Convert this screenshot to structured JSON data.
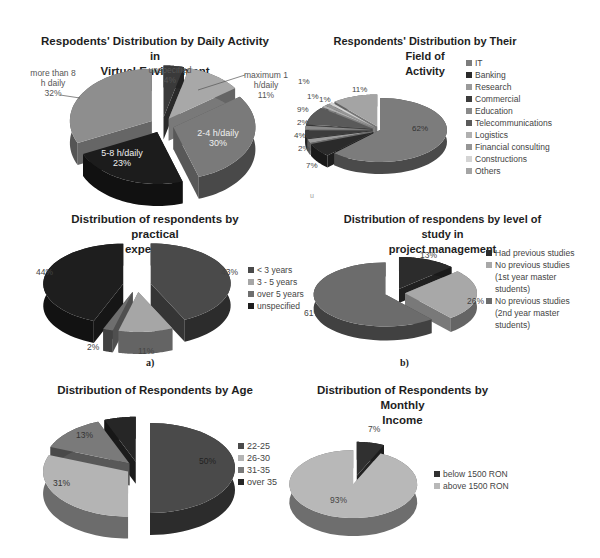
{
  "chart_data": [
    {
      "id": "daily-activity",
      "type": "pie",
      "title": "Respodents' Distribution by Daily Activity in Virtual Environment",
      "title_lines": [
        "Respodents' Distribution by Daily Activity in",
        "Virtual Environment"
      ],
      "categories": [
        "unspecified",
        "maximum 1 h/daily",
        "2-4 h/daily",
        "5-8 h/daily",
        "more than 8 h daily"
      ],
      "values": [
        4,
        11,
        30,
        23,
        32
      ],
      "value_labels": [
        "4%",
        "11%",
        "30%",
        "23%",
        "32%"
      ],
      "colors": [
        "#3a3a3a",
        "#a8a8a8",
        "#7a7a7a",
        "#1c1c1c",
        "#8e8e8e"
      ],
      "legend": "none (data labels)",
      "exploded": true
    },
    {
      "id": "field-of-activity",
      "type": "pie",
      "title": "Respondents' Distribution by Their Field of Activity",
      "title_lines": [
        "Respondents' Distribution by Their Field of",
        "Activity"
      ],
      "categories": [
        "IT",
        "Banking",
        "Research",
        "Commercial",
        "Education",
        "Telecommunications",
        "Logistics",
        "Financial consulting",
        "Constructions",
        "Others"
      ],
      "values": [
        62,
        7,
        2,
        4,
        2,
        9,
        1,
        1,
        1,
        11
      ],
      "value_labels": [
        "62%",
        "7%",
        "2%",
        "4%",
        "2%",
        "9%",
        "1%",
        "1%",
        "1%",
        "11%"
      ],
      "colors": [
        "#7c7c7c",
        "#2a2a2a",
        "#9a9a9a",
        "#3c3c3c",
        "#8a8a8a",
        "#5a5a5a",
        "#b0b0b0",
        "#969696",
        "#d4d4d4",
        "#a4a4a4"
      ],
      "legend": "right",
      "exploded": true
    },
    {
      "id": "practical-experience",
      "type": "pie",
      "title": "Distribution of respondents by practical experience",
      "title_lines": [
        "Distribution of respondents by practical",
        "experience"
      ],
      "categories": [
        "< 3 years",
        "3 - 5 years",
        "over 5 years",
        "unspecified"
      ],
      "values": [
        43,
        11,
        2,
        44
      ],
      "value_labels": [
        "43%",
        "11%",
        "2%",
        "44%"
      ],
      "colors": [
        "#4a4a4a",
        "#a6a6a6",
        "#6e6e6e",
        "#1e1e1e"
      ],
      "legend": "right",
      "exploded": true,
      "sublabel": "a)"
    },
    {
      "id": "study-level",
      "type": "pie",
      "title": "Distribution of respondens by level of study in project management",
      "title_lines": [
        "Distribution of respondens by level of study in",
        "project management"
      ],
      "categories": [
        "Had previous studies",
        "No previous studies (1st year master students)",
        "No previous studies (2nd year master students)"
      ],
      "values": [
        13,
        26,
        61
      ],
      "value_labels": [
        "13%",
        "26%",
        "61%"
      ],
      "colors": [
        "#2c2c2c",
        "#a8a8a8",
        "#6c6c6c"
      ],
      "legend": "right",
      "exploded": true,
      "sublabel": "b)"
    },
    {
      "id": "age",
      "type": "pie",
      "title": "Distribution of Respondents by Age",
      "title_lines": [
        "Distribution of Respondents by Age"
      ],
      "categories": [
        "22-25",
        "26-30",
        "31-35",
        "over 35"
      ],
      "values": [
        50,
        31,
        13,
        6
      ],
      "value_labels": [
        "50%",
        "31%",
        "13%",
        ""
      ],
      "colors": [
        "#4a4a4a",
        "#b4b4b4",
        "#7a7a7a",
        "#262626"
      ],
      "legend": "right",
      "exploded": true
    },
    {
      "id": "monthly-income",
      "type": "pie",
      "title": "Distribution of Respondents by Monthly Income",
      "title_lines": [
        "Distribution of Respondents by Monthly",
        "Income"
      ],
      "categories": [
        "below 1500 RON",
        "above 1500 RON"
      ],
      "values": [
        7,
        93
      ],
      "value_labels": [
        "7%",
        "93%"
      ],
      "colors": [
        "#303030",
        "#b8b8b8"
      ],
      "legend": "right",
      "exploded": true
    }
  ],
  "stray_marks": [
    "u"
  ]
}
